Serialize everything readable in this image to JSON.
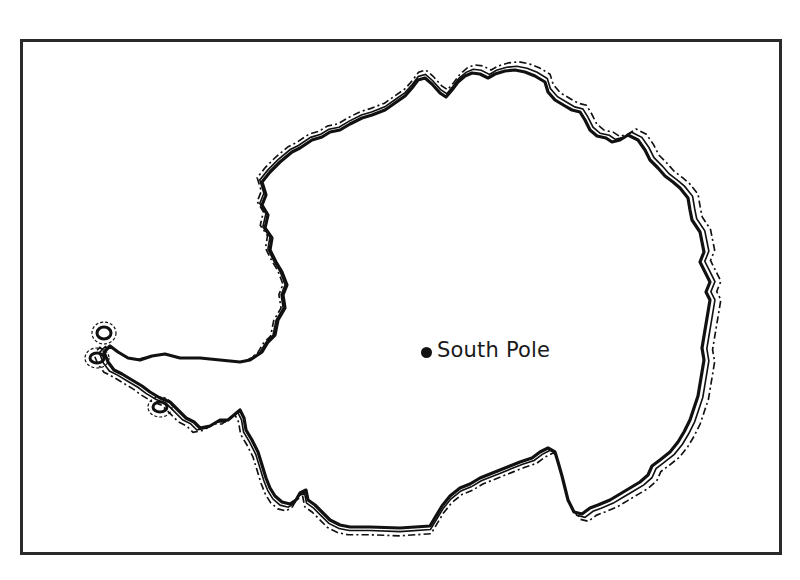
{
  "map": {
    "title": "",
    "region": "Antarctica outline",
    "border_color": "#2a2a2a",
    "coast_color": "#111111",
    "background": "#ffffff",
    "markers": [
      {
        "label": "South Pole",
        "icon": "dot-marker-icon"
      }
    ]
  }
}
